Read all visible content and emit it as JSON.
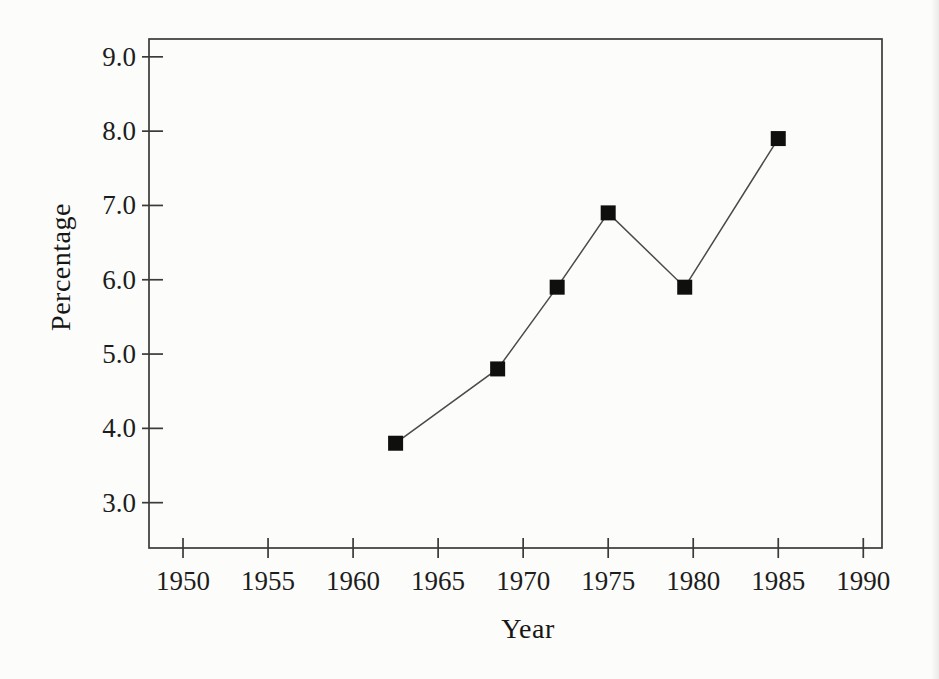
{
  "chart_data": {
    "type": "line",
    "title": "",
    "xlabel": "Year",
    "ylabel": "Percentage",
    "series": [
      {
        "name": "percentage-by-year",
        "x": [
          1962.5,
          1968.5,
          1972,
          1975,
          1979.5,
          1985
        ],
        "y": [
          3.8,
          4.8,
          5.9,
          6.9,
          5.9,
          7.9
        ]
      }
    ],
    "x_tick_labels": [
      "1950",
      "1955",
      "1960",
      "1965",
      "1970",
      "1975",
      "1980",
      "1985",
      "1990"
    ],
    "y_tick_labels": [
      "9.0",
      "8.0",
      "7.0",
      "6.0",
      "5.0",
      "4.0",
      "3.0"
    ],
    "xlim": [
      1948.0,
      1991.1
    ],
    "ylim": [
      2.39,
      9.24
    ],
    "grid": false,
    "legend_position": "none",
    "marker_shape": "filled-square",
    "marker_size_px": 15,
    "colors": {
      "line": "#4a4a46",
      "marker": "#0f0f0e",
      "axis": "#3a3a38",
      "tick_text": "#1d1d1c",
      "background": "#fcfcfb"
    }
  }
}
